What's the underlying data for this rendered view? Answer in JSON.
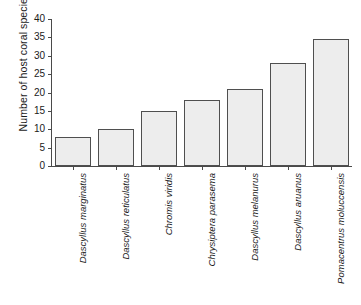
{
  "chart_data": {
    "type": "bar",
    "title": "",
    "xlabel": "",
    "ylabel": "Number of host coral species",
    "ylim": [
      0,
      40
    ],
    "yticks": [
      0,
      5,
      10,
      15,
      20,
      25,
      30,
      35,
      40
    ],
    "grid": false,
    "legend": null,
    "categories": [
      "Dascyllus marginatus",
      "Dascyllus reticulatus",
      "Chromis viridis",
      "Chrysiptera parasema",
      "Dascyllus melanurus",
      "Dascyllus aruanus",
      "Pomacentrus moluccensis"
    ],
    "values": [
      8,
      10,
      15,
      18,
      21,
      28,
      34.5
    ],
    "bar_fill": "#ededed",
    "bar_edge": "#4f4f4f",
    "axis_color": "#4a4a4a"
  }
}
